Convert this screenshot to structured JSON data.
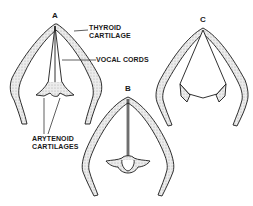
{
  "figure": {
    "panels": [
      {
        "id": "A",
        "label": "A"
      },
      {
        "id": "B",
        "label": "B"
      },
      {
        "id": "C",
        "label": "C"
      }
    ],
    "annotations": {
      "thyroid_line1": "THYROID",
      "thyroid_line2": "CARTILAGE",
      "vocal_cords": "VOCAL CORDS",
      "arytenoid_line1": "ARYTENOID",
      "arytenoid_line2": "CARTILAGES"
    },
    "colors": {
      "stroke": "#1a1a1a",
      "stipple_fill": "#d9d9d9",
      "background": "#ffffff"
    }
  }
}
